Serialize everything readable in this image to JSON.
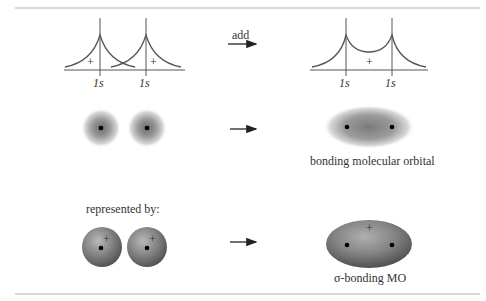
{
  "diagram": {
    "top_row": {
      "left_labels": [
        "1s",
        "1s"
      ],
      "left_signs": [
        "+",
        "+"
      ],
      "operation_label": "add",
      "right_labels": [
        "1s",
        "1s"
      ],
      "right_sign": "+"
    },
    "middle_row": {
      "caption": "bonding molecular orbital"
    },
    "bottom_row": {
      "intro": "represented by:",
      "left_signs": [
        "+",
        "+"
      ],
      "right_sign": "+",
      "caption": "σ-bonding MO"
    },
    "colors": {
      "line": "#555555",
      "rule": "#d8d8d8",
      "orbital_gray": "#7a7a7a"
    }
  }
}
